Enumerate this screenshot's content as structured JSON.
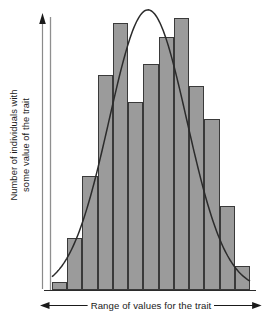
{
  "figure": {
    "background_color": "#ffffff",
    "line_color": "#2b2b2b",
    "bar_fill_color": "#9b9b9b",
    "bar_edge_color": "#3a3a3a"
  },
  "axes": {
    "y_label_line1": "Number of individuals with",
    "y_label_line2": "some value of the trait",
    "x_label": "Range of values for the trait",
    "y_axis_arrow": "up-arrow-icon",
    "x_axis_arrow_left": "left-arrow-icon",
    "x_axis_arrow_right": "right-arrow-icon",
    "grid": false,
    "tick_labels_x": [],
    "tick_labels_y": []
  },
  "chart_data": {
    "type": "bar",
    "title": "",
    "xlabel": "Range of values for the trait",
    "ylabel": "Number of individuals with some value of the trait",
    "grid": false,
    "legend": false,
    "xlim": [
      0,
      13
    ],
    "ylim": [
      0,
      100
    ],
    "categories": [
      "1",
      "2",
      "3",
      "4",
      "5",
      "6",
      "7",
      "8",
      "9",
      "10",
      "11",
      "12",
      "13"
    ],
    "values": [
      3,
      19,
      42,
      79,
      98,
      69,
      83,
      93,
      100,
      75,
      63,
      31,
      9
    ],
    "bar_width_fraction": 1.0,
    "overlay": {
      "type": "line",
      "name": "normal curve",
      "mean": 6.3,
      "sigma": 2.55,
      "peak_value": 103,
      "x": [
        0.0,
        0.5,
        1.0,
        1.5,
        2.0,
        2.5,
        3.0,
        3.5,
        4.0,
        4.5,
        5.0,
        5.5,
        6.0,
        6.3,
        6.5,
        7.0,
        7.5,
        8.0,
        8.5,
        9.0,
        9.5,
        10.0,
        10.5,
        11.0,
        11.5,
        12.0,
        12.5,
        13.0
      ],
      "y": [
        2.1,
        3.7,
        6.2,
        10.0,
        15.4,
        22.6,
        31.7,
        42.3,
        53.8,
        65.3,
        75.8,
        84.6,
        91.1,
        103.0,
        95.1,
        96.5,
        94.8,
        89.9,
        82.3,
        72.7,
        62.1,
        51.2,
        40.8,
        31.4,
        23.2,
        16.5,
        11.2,
        7.4
      ]
    }
  }
}
